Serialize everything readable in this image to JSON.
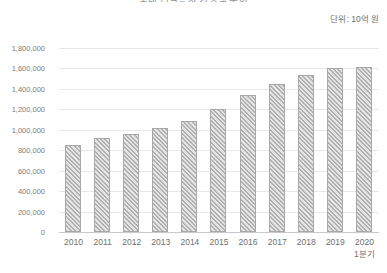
{
  "chart_data": {
    "type": "bar",
    "title": "국내 건설공사 기성액 추이",
    "subtitle": "",
    "unit_note": "단위: 10억 원",
    "xlabel": "",
    "ylabel": "",
    "grid": true,
    "legend": "none",
    "ylim": [
      0,
      1800000
    ],
    "ytick_labels": [
      "1,800,000",
      "1,600,000",
      "1,400,000",
      "1,200,000",
      "1,000,000",
      "800,000",
      "600,000",
      "400,000",
      "200,000",
      "0"
    ],
    "ytick_values": [
      1800000,
      1600000,
      1400000,
      1200000,
      1000000,
      800000,
      600000,
      400000,
      200000,
      0
    ],
    "categories": [
      "2010",
      "2011",
      "2012",
      "2013",
      "2014",
      "2015",
      "2016",
      "2017",
      "2018",
      "2019",
      "2020"
    ],
    "category_sublabels": [
      "",
      "",
      "",
      "",
      "",
      "",
      "",
      "",
      "",
      "",
      "1분기"
    ],
    "values": [
      850000,
      920000,
      960000,
      1020000,
      1090000,
      1200000,
      1340000,
      1450000,
      1540000,
      1600000,
      1610000
    ],
    "series": [
      {
        "name": "기성액",
        "values": [
          850000,
          920000,
          960000,
          1020000,
          1090000,
          1200000,
          1340000,
          1450000,
          1540000,
          1600000,
          1610000
        ]
      }
    ],
    "colors": {
      "bar_fill": "#bdbdbd",
      "bar_hatch": "#b0b0b0",
      "bar_border": "#a8a8a8",
      "gridline": "#e8e8e8",
      "baseline": "#c9c9c9",
      "text": "#6f6f6f"
    }
  }
}
